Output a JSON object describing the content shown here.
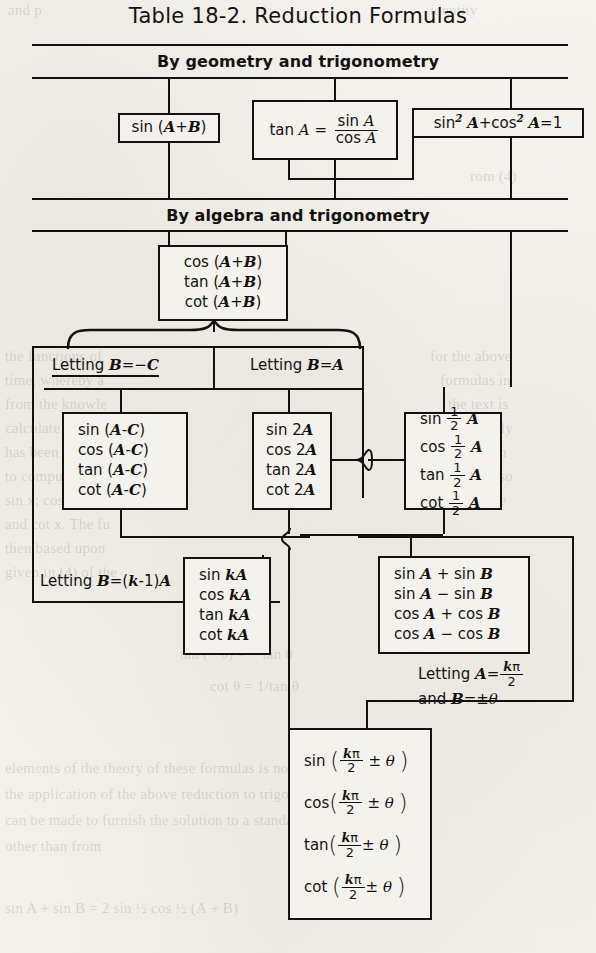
{
  "title": "Table 18-2. Reduction Formulas",
  "bands": [
    {
      "id": "geometry",
      "label": "By geometry and trigonometry"
    },
    {
      "id": "algebra",
      "label": "By algebra and trigonometry"
    }
  ],
  "boxes": {
    "sin_sum": {
      "lines": [
        "sin (A+B)"
      ]
    },
    "tan_identity": {
      "lines": [
        "tan A = sin A / cos A"
      ],
      "numerator": "sin A",
      "denominator": "cos A",
      "lhs": "tan A ="
    },
    "pythagorean": {
      "lines": [
        "sin² A+cos² A=1"
      ]
    },
    "cos_tan_cot_sum": {
      "lines": [
        "cos (A+B)",
        "tan (A+B)",
        "cot (A+B)"
      ]
    },
    "difference": {
      "lines": [
        "sin (A-C)",
        "cos (A-C)",
        "tan (A-C)",
        "cot (A-C)"
      ]
    },
    "double_angle": {
      "lines": [
        "sin 2A",
        "cos 2A",
        "tan 2A",
        "cot 2A"
      ]
    },
    "half_angle": {
      "lines": [
        "sin ½ A",
        "cos ½ A",
        "tan ½ A",
        "cot ½ A"
      ]
    },
    "multiple_angle": {
      "lines": [
        "sin kA",
        "cos kA",
        "tan kA",
        "cot kA"
      ]
    },
    "sum_to_product": {
      "lines": [
        "sin A + sin B",
        "sin A − sin B",
        "cos A + cos B",
        "cos A − cos B"
      ]
    },
    "reduction": {
      "lines": [
        "sin ( kπ/2 ± θ )",
        "cos ( kπ/2 ± θ )",
        "tan ( kπ/2 ± θ )",
        "cot ( kπ/2 ± θ )"
      ]
    }
  },
  "labels": {
    "letting_b_neg_c": "Letting B=−C",
    "letting_b_a": "Letting B=A",
    "letting_b_k_minus_1_a": "Letting B=(k-1)A",
    "letting_a_kpi_over_2": "Letting A=kπ/2",
    "and_b_plus_minus_theta": "and B=±θ"
  },
  "colors": {
    "ink": "#14120f",
    "paper": "#f3f1ec"
  },
  "ghost_text": [
    {
      "text": "and p",
      "x": 8,
      "y": 2
    },
    {
      "text": "identity",
      "x": 430,
      "y": 2
    },
    {
      "text": "rom (4)",
      "x": 470,
      "y": 168
    },
    {
      "text": "the functions of",
      "x": 5,
      "y": 348
    },
    {
      "text": "time, whereby a",
      "x": 5,
      "y": 372
    },
    {
      "text": "from the knowle",
      "x": 5,
      "y": 396
    },
    {
      "text": "calculate the val",
      "x": 5,
      "y": 420
    },
    {
      "text": "has been used to",
      "x": 5,
      "y": 444
    },
    {
      "text": "to compute the",
      "x": 5,
      "y": 468
    },
    {
      "text": "sin x; cos x, tan",
      "x": 5,
      "y": 492
    },
    {
      "text": "and cot x. The fu",
      "x": 5,
      "y": 516
    },
    {
      "text": "then based upon",
      "x": 5,
      "y": 540
    },
    {
      "text": "given in (4) of the",
      "x": 5,
      "y": 564
    },
    {
      "text": "for the above",
      "x": 430,
      "y": 348
    },
    {
      "text": "formulas in",
      "x": 440,
      "y": 372
    },
    {
      "text": "the text is",
      "x": 448,
      "y": 396
    },
    {
      "text": "wholly",
      "x": 470,
      "y": 420
    },
    {
      "text": "It is then",
      "x": 452,
      "y": 444
    },
    {
      "text": "found also",
      "x": 448,
      "y": 468
    },
    {
      "text": "that the",
      "x": 460,
      "y": 492
    },
    {
      "text": "tan (− θ)    =  − tan θ",
      "x": 180,
      "y": 646
    },
    {
      "text": "cot θ  =  1/tan θ",
      "x": 210,
      "y": 678
    },
    {
      "text": "elements of the theory of these formulas is not",
      "x": 5,
      "y": 760
    },
    {
      "text": "the application of the above reduction to trigono",
      "x": 5,
      "y": 786
    },
    {
      "text": "can be made to furnish the solution to a standard prob",
      "x": 5,
      "y": 812
    },
    {
      "text": "other than from",
      "x": 5,
      "y": 838
    },
    {
      "text": "sin A + sin B  =  2 sin ½ cos ½ (A + B)",
      "x": 5,
      "y": 900
    }
  ]
}
